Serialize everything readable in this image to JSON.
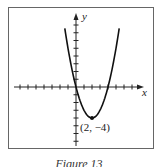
{
  "figure": {
    "caption": "Figure 13",
    "x_axis_label": "x",
    "y_axis_label": "y",
    "vertex_label": "(2, −4)",
    "colors": {
      "frame": "#555555",
      "axis": "#222222",
      "curve": "#111111"
    }
  },
  "chart_data": {
    "type": "line",
    "title": "Figure 13",
    "xlabel": "x",
    "ylabel": "y",
    "function": "y = x^2 - 4x",
    "x": [
      -1.4,
      -1,
      0,
      1,
      2,
      3,
      4,
      5,
      5.4
    ],
    "series": [
      {
        "name": "parabola",
        "values": [
          7.56,
          5,
          0,
          -3,
          -4,
          -3,
          0,
          5,
          7.56
        ]
      }
    ],
    "annotations": [
      {
        "x": 2,
        "y": -4,
        "text": "(2, −4)",
        "marker": "point"
      }
    ],
    "xlim": [
      -8,
      8
    ],
    "ylim": [
      -8,
      8
    ],
    "grid": false,
    "ticks": "unit ticks, unlabeled"
  }
}
